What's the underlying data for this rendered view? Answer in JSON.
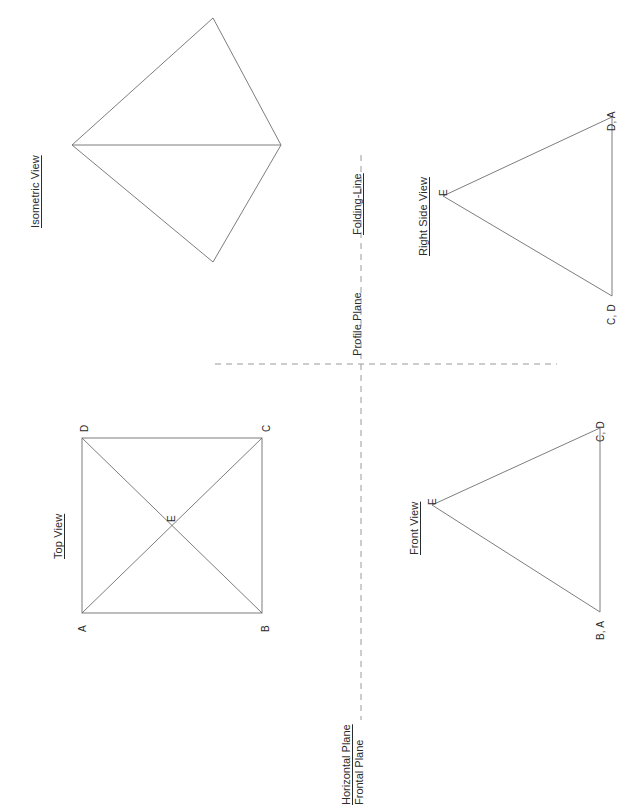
{
  "page": {
    "background_color": "#ffffff",
    "line_color": "#6e6e6e",
    "fold_line_color": "#9a9a9a",
    "text_color": "#2b2b2b",
    "width": 627,
    "height": 809
  },
  "views": {
    "isometric": {
      "title": "Isometric View",
      "title_underlined": true
    },
    "top": {
      "title": "Top View",
      "title_underlined": true,
      "vertices": [
        {
          "label": "D",
          "position": "top-left"
        },
        {
          "label": "C",
          "position": "top-right"
        },
        {
          "label": "A",
          "position": "bottom-left"
        },
        {
          "label": "B",
          "position": "bottom-right"
        },
        {
          "label": "E",
          "position": "center"
        }
      ]
    },
    "right_side": {
      "title": "Right Side View",
      "title_underlined": true,
      "vertices": [
        {
          "label": "E",
          "position": "apex-left"
        },
        {
          "label": "D, A",
          "position": "top-right"
        },
        {
          "label": "C, D",
          "position": "bottom-right"
        }
      ]
    },
    "front": {
      "title": "Front View",
      "title_underlined": true,
      "vertices": [
        {
          "label": "E",
          "position": "apex-left"
        },
        {
          "label": "C, D",
          "position": "top-right"
        },
        {
          "label": "B, A",
          "position": "bottom-right"
        }
      ]
    }
  },
  "fold_lines": {
    "vertical_label": "Folding-Line",
    "vertical_label_underlined": true,
    "profile_plane_label": "Profile Plane",
    "horizontal_plane_label": "Horizontal Plane",
    "frontal_plane_label": "Frontal Plane"
  }
}
